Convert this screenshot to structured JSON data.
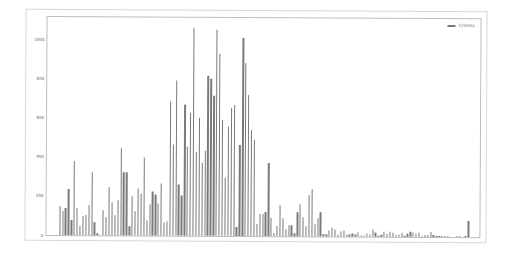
{
  "chart_data": {
    "type": "bar",
    "title": "",
    "xlabel": "",
    "ylabel": "",
    "ylim": [
      0,
      1100
    ],
    "yticks": [
      0,
      200,
      400,
      600,
      800,
      1000
    ],
    "grid": false,
    "legend": {
      "position": "upper right",
      "entries": [
        "Crimes"
      ]
    },
    "series": [
      {
        "name": "Crimes",
        "color": "#7a7a7a",
        "values": [
          0,
          0,
          0,
          150,
          120,
          140,
          235,
          75,
          380,
          140,
          45,
          95,
          100,
          155,
          320,
          65,
          10,
          0,
          130,
          90,
          245,
          170,
          100,
          180,
          445,
          320,
          320,
          45,
          200,
          125,
          240,
          215,
          400,
          75,
          160,
          225,
          210,
          165,
          265,
          65,
          70,
          685,
          465,
          790,
          260,
          205,
          670,
          455,
          630,
          1060,
          430,
          600,
          370,
          435,
          815,
          800,
          715,
          1050,
          930,
          590,
          295,
          555,
          655,
          670,
          45,
          465,
          1010,
          885,
          720,
          540,
          490,
          60,
          110,
          110,
          120,
          370,
          90,
          15,
          50,
          160,
          90,
          35,
          55,
          55,
          15,
          120,
          165,
          95,
          50,
          210,
          240,
          60,
          90,
          120,
          10,
          10,
          30,
          45,
          35,
          10,
          25,
          30,
          10,
          10,
          15,
          10,
          20,
          5,
          5,
          15,
          10,
          35,
          20,
          5,
          10,
          25,
          15,
          25,
          20,
          10,
          10,
          20,
          5,
          15,
          25,
          20,
          15,
          20,
          5,
          10,
          10,
          25,
          10,
          5,
          5,
          5,
          5,
          5,
          0,
          0,
          5,
          5,
          0,
          5,
          80,
          0
        ]
      }
    ]
  }
}
